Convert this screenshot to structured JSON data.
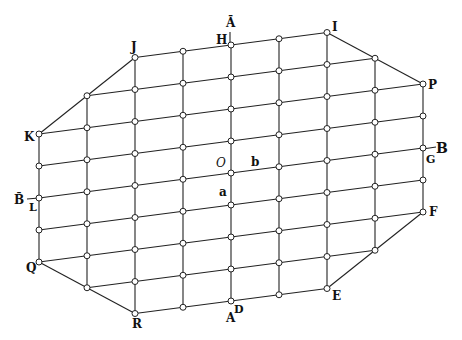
{
  "diagram": {
    "type": "lattice-octagon",
    "stroke_color": "#222222",
    "node_fill": "#ffffff",
    "grid": {
      "origin_x": 39,
      "origin_y": 134,
      "col_dx": 48,
      "col_dy": -6.25,
      "row_dy": 32,
      "node_radius": 3,
      "columns": [
        {
          "c": 0,
          "r_min": 0,
          "r_max": 4
        },
        {
          "c": 1,
          "r_min": -1,
          "r_max": 5
        },
        {
          "c": 2,
          "r_min": -2,
          "r_max": 6
        },
        {
          "c": 3,
          "r_min": -2,
          "r_max": 6
        },
        {
          "c": 4,
          "r_min": -2,
          "r_max": 6
        },
        {
          "c": 5,
          "r_min": -2,
          "r_max": 6
        },
        {
          "c": 6,
          "r_min": -2,
          "r_max": 6
        },
        {
          "c": 7,
          "r_min": -1,
          "r_max": 5
        },
        {
          "c": 8,
          "r_min": 0,
          "r_max": 4
        }
      ]
    },
    "boundary_vertices": [
      "K",
      "J",
      "I",
      "P",
      "F",
      "E",
      "R",
      "Q"
    ],
    "labels": [
      {
        "text": "J",
        "x": 131,
        "y": 51,
        "italic": false,
        "size": 12
      },
      {
        "text": "H",
        "x": 216,
        "y": 44,
        "italic": false,
        "size": 12
      },
      {
        "text": "Ā",
        "x": 226,
        "y": 27,
        "italic": false,
        "size": 12
      },
      {
        "text": "I",
        "x": 332,
        "y": 31,
        "italic": false,
        "size": 12
      },
      {
        "text": "P",
        "x": 428,
        "y": 89,
        "italic": false,
        "size": 12
      },
      {
        "text": "B",
        "x": 436,
        "y": 153,
        "italic": false,
        "size": 14
      },
      {
        "text": "G",
        "x": 426,
        "y": 163,
        "italic": false,
        "size": 11
      },
      {
        "text": "F",
        "x": 429,
        "y": 216,
        "italic": false,
        "size": 12
      },
      {
        "text": "E",
        "x": 332,
        "y": 300,
        "italic": false,
        "size": 12
      },
      {
        "text": "D",
        "x": 234,
        "y": 313,
        "italic": false,
        "size": 11
      },
      {
        "text": "A",
        "x": 226,
        "y": 322,
        "italic": false,
        "size": 12
      },
      {
        "text": "R",
        "x": 132,
        "y": 328,
        "italic": false,
        "size": 12
      },
      {
        "text": "Q",
        "x": 26,
        "y": 272,
        "italic": false,
        "size": 12
      },
      {
        "text": "L",
        "x": 29,
        "y": 211,
        "italic": false,
        "size": 11
      },
      {
        "text": "B̄",
        "x": 14,
        "y": 204,
        "italic": false,
        "size": 12
      },
      {
        "text": "K",
        "x": 24,
        "y": 141,
        "italic": false,
        "size": 12
      },
      {
        "text": "O",
        "x": 216,
        "y": 167,
        "italic": true,
        "size": 12
      },
      {
        "text": "b",
        "x": 251,
        "y": 166,
        "italic": false,
        "size": 12
      },
      {
        "text": "a",
        "x": 219,
        "y": 196,
        "italic": false,
        "size": 12
      }
    ],
    "axis_ticks": [
      {
        "name": "A-bar-axis-tick",
        "x1": 230,
        "y1": 32,
        "x2": 230,
        "y2": 46
      },
      {
        "name": "B-axis-tick",
        "x1": 423,
        "y1": 149,
        "x2": 436,
        "y2": 147
      },
      {
        "name": "B-bar-axis-tick",
        "x1": 27,
        "y1": 199,
        "x2": 39,
        "y2": 198
      }
    ]
  }
}
